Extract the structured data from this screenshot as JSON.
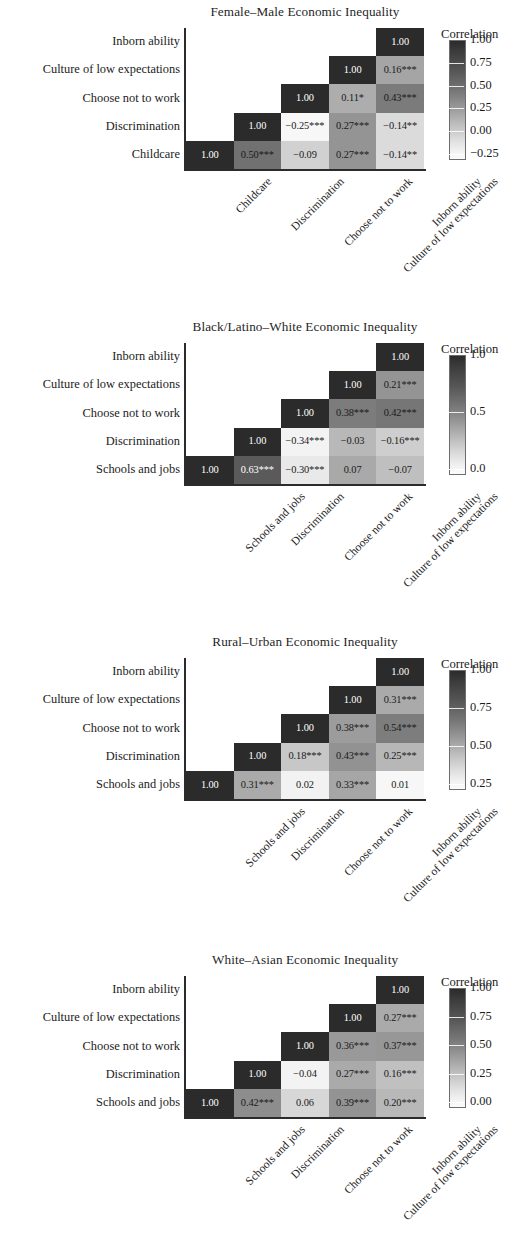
{
  "figure": {
    "type": "correlation-matrix-grid",
    "panel_count": 4,
    "font_style": "serif",
    "significance_note": "asterisks denote statistical significance"
  },
  "chart_data": [
    {
      "type": "heatmap",
      "title": "Female–Male Economic Inequality",
      "xlabel": "",
      "ylabel": "",
      "grid": false,
      "legend_position": "right",
      "triangular": "lower",
      "categories": [
        "Childcare",
        "Discrimination",
        "Choose not to work",
        "Culture of low expectations",
        "Inborn ability"
      ],
      "row_labels_top_to_bottom": [
        "Inborn ability",
        "Culture of low expectations",
        "Choose not to work",
        "Discrimination",
        "Childcare"
      ],
      "colorbar": {
        "title": "Correlation",
        "ticks": [
          "1.00",
          "0.75",
          "0.50",
          "0.25",
          "0.00",
          "−0.25"
        ],
        "vmin": -0.25,
        "vmax": 1.0
      },
      "cells": [
        {
          "row": 0,
          "col": 4,
          "value": 1.0,
          "label": "1.00"
        },
        {
          "row": 1,
          "col": 3,
          "value": 1.0,
          "label": "1.00"
        },
        {
          "row": 1,
          "col": 4,
          "value": 0.16,
          "label": "0.16***"
        },
        {
          "row": 2,
          "col": 2,
          "value": 1.0,
          "label": "1.00"
        },
        {
          "row": 2,
          "col": 3,
          "value": 0.11,
          "label": "0.11*"
        },
        {
          "row": 2,
          "col": 4,
          "value": 0.43,
          "label": "0.43***"
        },
        {
          "row": 3,
          "col": 1,
          "value": 1.0,
          "label": "1.00"
        },
        {
          "row": 3,
          "col": 2,
          "value": -0.25,
          "label": "−0.25***"
        },
        {
          "row": 3,
          "col": 3,
          "value": 0.27,
          "label": "0.27***"
        },
        {
          "row": 3,
          "col": 4,
          "value": -0.14,
          "label": "−0.14**"
        },
        {
          "row": 4,
          "col": 0,
          "value": 1.0,
          "label": "1.00"
        },
        {
          "row": 4,
          "col": 1,
          "value": 0.5,
          "label": "0.50***"
        },
        {
          "row": 4,
          "col": 2,
          "value": -0.09,
          "label": "−0.09"
        },
        {
          "row": 4,
          "col": 3,
          "value": 0.27,
          "label": "0.27***"
        },
        {
          "row": 4,
          "col": 4,
          "value": -0.14,
          "label": "−0.14**"
        }
      ]
    },
    {
      "type": "heatmap",
      "title": "Black/Latino–White Economic Inequality",
      "xlabel": "",
      "ylabel": "",
      "grid": false,
      "legend_position": "right",
      "triangular": "lower",
      "categories": [
        "Schools and jobs",
        "Discrimination",
        "Choose not to work",
        "Culture of low expectations",
        "Inborn ability"
      ],
      "row_labels_top_to_bottom": [
        "Inborn ability",
        "Culture of low expectations",
        "Choose not to work",
        "Discrimination",
        "Schools and jobs"
      ],
      "colorbar": {
        "title": "Correlation",
        "ticks": [
          "1.0",
          "0.5",
          "0.0"
        ],
        "vmin": -0.35,
        "vmax": 1.0
      },
      "cells": [
        {
          "row": 0,
          "col": 4,
          "value": 1.0,
          "label": "1.00"
        },
        {
          "row": 1,
          "col": 3,
          "value": 1.0,
          "label": "1.00"
        },
        {
          "row": 1,
          "col": 4,
          "value": 0.21,
          "label": "0.21***"
        },
        {
          "row": 2,
          "col": 2,
          "value": 1.0,
          "label": "1.00"
        },
        {
          "row": 2,
          "col": 3,
          "value": 0.38,
          "label": "0.38***"
        },
        {
          "row": 2,
          "col": 4,
          "value": 0.42,
          "label": "0.42***"
        },
        {
          "row": 3,
          "col": 1,
          "value": 1.0,
          "label": "1.00"
        },
        {
          "row": 3,
          "col": 2,
          "value": -0.34,
          "label": "−0.34***"
        },
        {
          "row": 3,
          "col": 3,
          "value": -0.03,
          "label": "−0.03"
        },
        {
          "row": 3,
          "col": 4,
          "value": -0.16,
          "label": "−0.16***"
        },
        {
          "row": 4,
          "col": 0,
          "value": 1.0,
          "label": "1.00"
        },
        {
          "row": 4,
          "col": 1,
          "value": 0.63,
          "label": "0.63***"
        },
        {
          "row": 4,
          "col": 2,
          "value": -0.3,
          "label": "−0.30***"
        },
        {
          "row": 4,
          "col": 3,
          "value": 0.07,
          "label": "0.07"
        },
        {
          "row": 4,
          "col": 4,
          "value": -0.07,
          "label": "−0.07"
        }
      ]
    },
    {
      "type": "heatmap",
      "title": "Rural–Urban Economic Inequality",
      "xlabel": "",
      "ylabel": "",
      "grid": false,
      "legend_position": "right",
      "triangular": "lower",
      "categories": [
        "Schools and jobs",
        "Discrimination",
        "Choose not to work",
        "Culture of low expectations",
        "Inborn ability"
      ],
      "row_labels_top_to_bottom": [
        "Inborn ability",
        "Culture of low expectations",
        "Choose not to work",
        "Discrimination",
        "Schools and jobs"
      ],
      "colorbar": {
        "title": "Correlation",
        "ticks": [
          "1.00",
          "0.75",
          "0.50",
          "0.25"
        ],
        "vmin": 0.01,
        "vmax": 1.0
      },
      "cells": [
        {
          "row": 0,
          "col": 4,
          "value": 1.0,
          "label": "1.00"
        },
        {
          "row": 1,
          "col": 3,
          "value": 1.0,
          "label": "1.00"
        },
        {
          "row": 1,
          "col": 4,
          "value": 0.31,
          "label": "0.31***"
        },
        {
          "row": 2,
          "col": 2,
          "value": 1.0,
          "label": "1.00"
        },
        {
          "row": 2,
          "col": 3,
          "value": 0.38,
          "label": "0.38***"
        },
        {
          "row": 2,
          "col": 4,
          "value": 0.54,
          "label": "0.54***"
        },
        {
          "row": 3,
          "col": 1,
          "value": 1.0,
          "label": "1.00"
        },
        {
          "row": 3,
          "col": 2,
          "value": 0.18,
          "label": "0.18***"
        },
        {
          "row": 3,
          "col": 3,
          "value": 0.43,
          "label": "0.43***"
        },
        {
          "row": 3,
          "col": 4,
          "value": 0.25,
          "label": "0.25***"
        },
        {
          "row": 4,
          "col": 0,
          "value": 1.0,
          "label": "1.00"
        },
        {
          "row": 4,
          "col": 1,
          "value": 0.31,
          "label": "0.31***"
        },
        {
          "row": 4,
          "col": 2,
          "value": 0.02,
          "label": "0.02"
        },
        {
          "row": 4,
          "col": 3,
          "value": 0.33,
          "label": "0.33***"
        },
        {
          "row": 4,
          "col": 4,
          "value": 0.01,
          "label": "0.01"
        }
      ]
    },
    {
      "type": "heatmap",
      "title": "White–Asian Economic Inequality",
      "xlabel": "",
      "ylabel": "",
      "grid": false,
      "legend_position": "right",
      "triangular": "lower",
      "categories": [
        "Schools and jobs",
        "Discrimination",
        "Choose not to work",
        "Culture of low expectations",
        "Inborn ability"
      ],
      "row_labels_top_to_bottom": [
        "Inborn ability",
        "Culture of low expectations",
        "Choose not to work",
        "Discrimination",
        "Schools and jobs"
      ],
      "colorbar": {
        "title": "Correlation",
        "ticks": [
          "1.00",
          "0.75",
          "0.50",
          "0.25",
          "0.00"
        ],
        "vmin": -0.05,
        "vmax": 1.0
      },
      "cells": [
        {
          "row": 0,
          "col": 4,
          "value": 1.0,
          "label": "1.00"
        },
        {
          "row": 1,
          "col": 3,
          "value": 1.0,
          "label": "1.00"
        },
        {
          "row": 1,
          "col": 4,
          "value": 0.27,
          "label": "0.27***"
        },
        {
          "row": 2,
          "col": 2,
          "value": 1.0,
          "label": "1.00"
        },
        {
          "row": 2,
          "col": 3,
          "value": 0.36,
          "label": "0.36***"
        },
        {
          "row": 2,
          "col": 4,
          "value": 0.37,
          "label": "0.37***"
        },
        {
          "row": 3,
          "col": 1,
          "value": 1.0,
          "label": "1.00"
        },
        {
          "row": 3,
          "col": 2,
          "value": -0.04,
          "label": "−0.04"
        },
        {
          "row": 3,
          "col": 3,
          "value": 0.27,
          "label": "0.27***"
        },
        {
          "row": 3,
          "col": 4,
          "value": 0.16,
          "label": "0.16***"
        },
        {
          "row": 4,
          "col": 0,
          "value": 1.0,
          "label": "1.00"
        },
        {
          "row": 4,
          "col": 1,
          "value": 0.42,
          "label": "0.42***"
        },
        {
          "row": 4,
          "col": 2,
          "value": 0.06,
          "label": "0.06"
        },
        {
          "row": 4,
          "col": 3,
          "value": 0.39,
          "label": "0.39***"
        },
        {
          "row": 4,
          "col": 4,
          "value": 0.2,
          "label": "0.20***"
        }
      ]
    }
  ],
  "layout": {
    "panel_tops": [
      0,
      315,
      630,
      948
    ],
    "title_top": 4,
    "matrix_top": 28,
    "matrix_left": 186,
    "cell_w": 47.6,
    "cell_h": 28.2,
    "legend_left": 444,
    "legend_title_left": 441,
    "cbar_top": 40,
    "cbar_h": 118
  }
}
